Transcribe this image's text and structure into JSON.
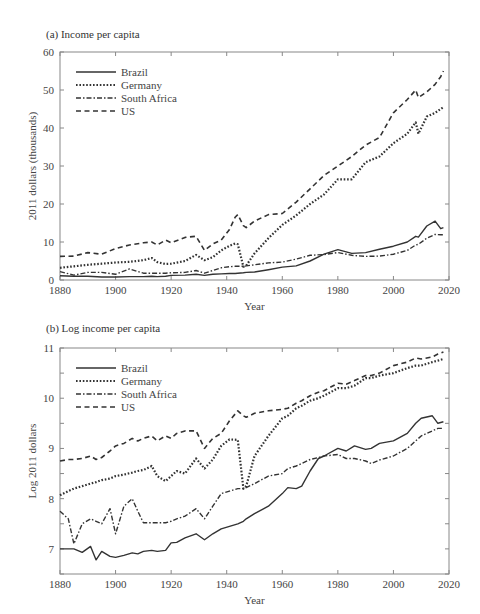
{
  "chart_data": [
    {
      "type": "line",
      "title": "(a) Income per capita",
      "xlabel": "Year",
      "ylabel": "2011 dollars (thousands)",
      "xlim": [
        1880,
        2020
      ],
      "ylim": [
        0,
        60
      ],
      "xticks": [
        1880,
        1900,
        1920,
        1940,
        1960,
        1980,
        2000,
        2020
      ],
      "yticks": [
        0,
        10,
        20,
        30,
        40,
        50,
        60
      ],
      "grid": false,
      "legend_position": "upper left",
      "x": [
        1880,
        1885,
        1890,
        1895,
        1900,
        1905,
        1910,
        1913,
        1915,
        1918,
        1920,
        1925,
        1929,
        1932,
        1935,
        1938,
        1941,
        1943,
        1944,
        1946,
        1947,
        1950,
        1955,
        1960,
        1965,
        1970,
        1975,
        1980,
        1985,
        1990,
        1995,
        2000,
        2005,
        2008,
        2009,
        2012,
        2015,
        2017,
        2018
      ],
      "series": [
        {
          "name": "Brazil",
          "style": "solid",
          "values": [
            1.1,
            1.0,
            1.0,
            0.8,
            0.8,
            0.9,
            0.9,
            1.0,
            0.9,
            1.0,
            1.2,
            1.3,
            1.5,
            1.2,
            1.5,
            1.6,
            1.7,
            1.7,
            1.8,
            1.9,
            2.0,
            2.1,
            2.7,
            3.4,
            3.7,
            5.0,
            6.8,
            8.0,
            7.0,
            7.2,
            8.1,
            8.9,
            10.0,
            11.5,
            11.3,
            14.2,
            15.5,
            13.5,
            13.8
          ]
        },
        {
          "name": "Germany",
          "style": "dotted",
          "values": [
            3.2,
            3.6,
            4.0,
            4.3,
            4.6,
            4.8,
            5.2,
            5.8,
            4.7,
            4.2,
            4.3,
            5.0,
            6.6,
            5.2,
            6.0,
            7.8,
            9.0,
            9.6,
            9.4,
            3.5,
            3.8,
            7.0,
            11.0,
            14.5,
            17.0,
            20.0,
            22.5,
            26.5,
            26.5,
            31.0,
            32.5,
            36.0,
            38.5,
            41.5,
            38.5,
            43.0,
            44.0,
            45.0,
            45.5
          ]
        },
        {
          "name": "South Africa",
          "style": "dashdot",
          "values": [
            2.2,
            1.3,
            2.0,
            2.0,
            1.5,
            2.9,
            1.8,
            1.8,
            1.8,
            1.8,
            1.9,
            2.0,
            2.5,
            1.8,
            2.5,
            3.2,
            3.5,
            3.6,
            3.6,
            3.6,
            3.7,
            4.0,
            4.5,
            4.7,
            5.5,
            6.5,
            6.7,
            7.2,
            6.5,
            6.2,
            6.3,
            6.8,
            7.8,
            9.2,
            9.4,
            11.0,
            12.0,
            11.9,
            11.9
          ]
        },
        {
          "name": "US",
          "style": "dashed",
          "values": [
            6.2,
            6.3,
            7.2,
            6.8,
            8.3,
            9.2,
            9.8,
            10.0,
            9.2,
            10.5,
            9.8,
            11.2,
            11.5,
            7.8,
            9.5,
            10.5,
            13.3,
            16.5,
            17.2,
            14.3,
            13.8,
            15.5,
            17.2,
            17.5,
            20.5,
            24.0,
            27.5,
            30.0,
            32.5,
            35.5,
            37.5,
            44.0,
            47.5,
            50.0,
            48.0,
            49.5,
            51.5,
            53.5,
            55.0
          ]
        }
      ]
    },
    {
      "type": "line",
      "title": "(b) Log income per capita",
      "xlabel": "Year",
      "ylabel": "Log 2011 dollars",
      "xlim": [
        1880,
        2020
      ],
      "ylim": [
        6.5,
        11
      ],
      "xticks": [
        1880,
        1900,
        1920,
        1940,
        1960,
        1980,
        2000,
        2020
      ],
      "yticks": [
        7,
        8,
        9,
        10,
        11
      ],
      "grid": false,
      "legend_position": "upper left",
      "x": [
        1880,
        1883,
        1885,
        1888,
        1891,
        1893,
        1895,
        1898,
        1900,
        1903,
        1906,
        1908,
        1910,
        1913,
        1915,
        1918,
        1920,
        1922,
        1925,
        1929,
        1932,
        1935,
        1938,
        1941,
        1944,
        1946,
        1947,
        1950,
        1955,
        1960,
        1962,
        1965,
        1967,
        1970,
        1973,
        1975,
        1980,
        1983,
        1986,
        1990,
        1992,
        1995,
        2000,
        2005,
        2008,
        2010,
        2014,
        2016,
        2018
      ],
      "series": [
        {
          "name": "Brazil",
          "style": "solid",
          "values": [
            7.0,
            7.0,
            7.0,
            6.93,
            7.05,
            6.78,
            6.95,
            6.85,
            6.83,
            6.87,
            6.92,
            6.9,
            6.95,
            6.97,
            6.95,
            6.97,
            7.12,
            7.13,
            7.22,
            7.3,
            7.18,
            7.3,
            7.4,
            7.45,
            7.5,
            7.55,
            7.6,
            7.7,
            7.85,
            8.1,
            8.22,
            8.2,
            8.25,
            8.55,
            8.8,
            8.85,
            9.0,
            8.95,
            9.05,
            8.98,
            9.0,
            9.1,
            9.15,
            9.3,
            9.5,
            9.6,
            9.65,
            9.5,
            9.53
          ]
        },
        {
          "name": "Germany",
          "style": "dotted",
          "values": [
            8.07,
            8.15,
            8.2,
            8.25,
            8.3,
            8.33,
            8.37,
            8.4,
            8.45,
            8.48,
            8.52,
            8.55,
            8.57,
            8.65,
            8.45,
            8.35,
            8.45,
            8.55,
            8.5,
            8.8,
            8.6,
            8.78,
            9.05,
            9.18,
            9.17,
            8.2,
            8.25,
            8.85,
            9.25,
            9.6,
            9.65,
            9.8,
            9.85,
            9.95,
            10.0,
            10.05,
            10.2,
            10.2,
            10.25,
            10.4,
            10.4,
            10.45,
            10.5,
            10.6,
            10.65,
            10.65,
            10.72,
            10.75,
            10.78
          ]
        },
        {
          "name": "South Africa",
          "style": "dashdot",
          "values": [
            7.75,
            7.6,
            7.1,
            7.5,
            7.6,
            7.55,
            7.5,
            7.8,
            7.3,
            7.85,
            8.0,
            7.75,
            7.52,
            7.52,
            7.52,
            7.52,
            7.55,
            7.6,
            7.65,
            7.8,
            7.6,
            7.85,
            8.1,
            8.15,
            8.2,
            8.2,
            8.22,
            8.3,
            8.45,
            8.5,
            8.6,
            8.65,
            8.7,
            8.78,
            8.82,
            8.85,
            8.88,
            8.8,
            8.8,
            8.75,
            8.7,
            8.77,
            8.85,
            9.0,
            9.15,
            9.25,
            9.35,
            9.4,
            9.4
          ]
        },
        {
          "name": "US",
          "style": "dashed",
          "values": [
            8.75,
            8.78,
            8.78,
            8.8,
            8.85,
            8.78,
            8.82,
            8.95,
            9.05,
            9.1,
            9.2,
            9.15,
            9.2,
            9.25,
            9.15,
            9.25,
            9.2,
            9.3,
            9.35,
            9.35,
            9.0,
            9.2,
            9.3,
            9.55,
            9.75,
            9.65,
            9.62,
            9.7,
            9.75,
            9.78,
            9.8,
            9.9,
            9.95,
            10.05,
            10.12,
            10.15,
            10.3,
            10.28,
            10.35,
            10.45,
            10.45,
            10.5,
            10.65,
            10.72,
            10.8,
            10.78,
            10.82,
            10.88,
            10.92
          ]
        }
      ]
    }
  ],
  "panels": [
    {
      "title": "(a) Income per capita",
      "xlabel": "Year",
      "ylabel": "2011 dollars (thousands)",
      "xtick_labels": [
        "1880",
        "1900",
        "1920",
        "1940",
        "1960",
        "1980",
        "2000",
        "2020"
      ],
      "ytick_labels": [
        "0",
        "10",
        "20",
        "30",
        "40",
        "50",
        "60"
      ],
      "legend": [
        "Brazil",
        "Germany",
        "South Africa",
        "US"
      ]
    },
    {
      "title": "(b) Log income per capita",
      "xlabel": "Year",
      "ylabel": "Log 2011 dollars",
      "xtick_labels": [
        "1880",
        "1900",
        "1920",
        "1940",
        "1960",
        "1980",
        "2000",
        "2020"
      ],
      "ytick_labels": [
        "7",
        "8",
        "9",
        "10",
        "11"
      ],
      "legend": [
        "Brazil",
        "Germany",
        "South Africa",
        "US"
      ]
    }
  ],
  "colors": {
    "line": "#333333",
    "axis": "#888888",
    "text": "#444444"
  }
}
